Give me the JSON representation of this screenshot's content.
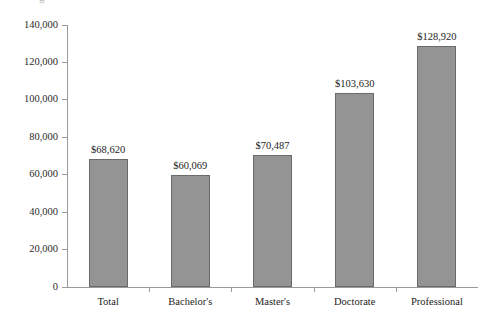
{
  "artifact": {
    "top_fragment": "g"
  },
  "chart_data": {
    "type": "bar",
    "title": "",
    "subtitle": "",
    "xlabel": "",
    "ylabel": "",
    "categories": [
      "Total",
      "Bachelor's",
      "Master's",
      "Doctorate",
      "Professional"
    ],
    "values": [
      68620,
      60069,
      70487,
      103630,
      128920
    ],
    "value_labels": [
      "$68,620",
      "$60,069",
      "$70,487",
      "$103,630",
      "$128,920"
    ],
    "ylim": [
      0,
      140000
    ],
    "ytick_values": [
      0,
      20000,
      40000,
      60000,
      80000,
      100000,
      120000,
      140000
    ],
    "ytick_labels": [
      "0",
      "20,000",
      "40,000",
      "60,000",
      "80,000",
      "100,000",
      "120,000",
      "140,000"
    ],
    "grid": false,
    "legend": null,
    "legend_position": "none",
    "bar_fill_color": "#949494",
    "bar_border_color": "#6a6a6a",
    "axis_color": "#9a9a9a",
    "background_color": "#ffffff",
    "series": [
      {
        "name": "Median annual earnings",
        "values": [
          68620,
          60069,
          70487,
          103630,
          128920
        ]
      }
    ]
  }
}
